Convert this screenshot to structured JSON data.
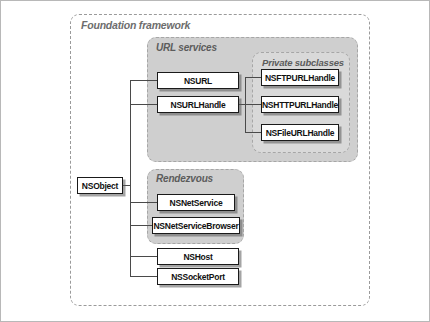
{
  "diagram": {
    "groups": {
      "foundation": "Foundation framework",
      "url_services": "URL services",
      "private_subclasses": "Private subclasses",
      "rendezvous": "Rendezvous"
    },
    "nodes": {
      "nsobject": "NSObject",
      "nsurl": "NSURL",
      "nsurlhandle": "NSURLHandle",
      "nsftpurlhandle": "NSFTPURLHandle",
      "nshttpurlhandle": "NSHTTPURLHandle",
      "nsfileurlhandle": "NSFileURLHandle",
      "nsnetservice": "NSNetService",
      "nsnetservicebrowser": "NSNetServiceBrowser",
      "nshost": "NSHost",
      "nssocketport": "NSSocketPort"
    },
    "colors": {
      "panel_gray": "#cfcfcf",
      "panel_gray_inner": "#d9d9d9",
      "node_border": "#1a1a1a",
      "node_fill": "#ffffff",
      "line": "#4a4a4a",
      "group_label": "#6d6d6d",
      "frame_border": "#9a9a9a"
    }
  }
}
